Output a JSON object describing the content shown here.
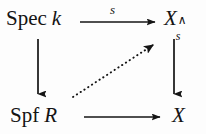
{
  "diagram": {
    "kind": "commutative-diagram",
    "background_color": "#fdfdfd",
    "ink_color": "#141414",
    "nodes": [
      {
        "id": "spec-k",
        "position": "top-left",
        "roman_part": "Spec",
        "italic_part": "k",
        "full_text": "Spec k"
      },
      {
        "id": "x-hat-s",
        "position": "top-right",
        "base": "X",
        "superscript": "∧",
        "subscript": "s",
        "full_text": "X_s^"
      },
      {
        "id": "spf-r",
        "position": "bottom-left",
        "roman_part": "Spf",
        "italic_part": "R",
        "full_text": "Spf R"
      },
      {
        "id": "x",
        "position": "bottom-right",
        "base": "X",
        "full_text": "X"
      }
    ],
    "arrows": [
      {
        "id": "top-horizontal",
        "from": "spec-k",
        "to": "x-hat-s",
        "style": "solid",
        "direction": "right",
        "label": "s"
      },
      {
        "id": "left-vertical",
        "from": "spec-k",
        "to": "spf-r",
        "style": "solid",
        "direction": "down",
        "label": ""
      },
      {
        "id": "right-vertical",
        "from": "x-hat-s",
        "to": "x",
        "style": "solid",
        "direction": "down",
        "label": ""
      },
      {
        "id": "bottom-horizontal",
        "from": "spf-r",
        "to": "x",
        "style": "solid",
        "direction": "right",
        "label": ""
      },
      {
        "id": "diagonal-lift",
        "from": "spf-r",
        "to": "x-hat-s",
        "style": "dotted",
        "direction": "up-right",
        "label": ""
      }
    ]
  }
}
